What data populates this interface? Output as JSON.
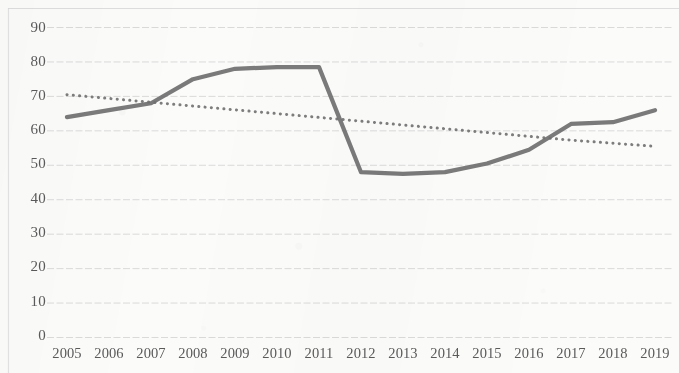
{
  "chart_data": {
    "type": "line",
    "title": "",
    "subtitle": "",
    "xlabel": "",
    "ylabel": "",
    "categories": [
      "2005",
      "2006",
      "2007",
      "2008",
      "2009",
      "2010",
      "2011",
      "2012",
      "2013",
      "2014",
      "2015",
      "2016",
      "2017",
      "2018",
      "2019"
    ],
    "x": [
      2005,
      2006,
      2007,
      2008,
      2009,
      2010,
      2011,
      2012,
      2013,
      2014,
      2015,
      2016,
      2017,
      2018,
      2019
    ],
    "series": [
      {
        "name": "data-series",
        "style": "solid",
        "color": "#6f6f6f",
        "values": [
          64,
          66,
          68,
          75,
          78,
          78.5,
          78.5,
          48,
          47.5,
          48,
          50.5,
          54.5,
          62,
          62.5,
          66
        ]
      },
      {
        "name": "trendline",
        "style": "dotted",
        "color": "#6f6f6f",
        "values": [
          70.5,
          69.4,
          68.3,
          67.2,
          66.1,
          65.0,
          63.9,
          62.8,
          61.7,
          60.6,
          59.5,
          58.4,
          57.3,
          56.4,
          55.5
        ]
      }
    ],
    "ylim": [
      0,
      90
    ],
    "xlim": [
      2005,
      2019
    ],
    "y_ticks": [
      "0",
      "10",
      "20",
      "30",
      "40",
      "50",
      "60",
      "70",
      "80",
      "90"
    ],
    "y_tick_values": [
      0,
      10,
      20,
      30,
      40,
      50,
      60,
      70,
      80,
      90
    ],
    "grid": {
      "horizontal": true,
      "vertical": false,
      "color": "#cfcfcf"
    },
    "legend": {
      "visible": false,
      "position": "none",
      "entries": []
    },
    "annotations": [],
    "axis_line_color": "#d8d8d8",
    "tick_label_color": "#5a5a5a"
  }
}
